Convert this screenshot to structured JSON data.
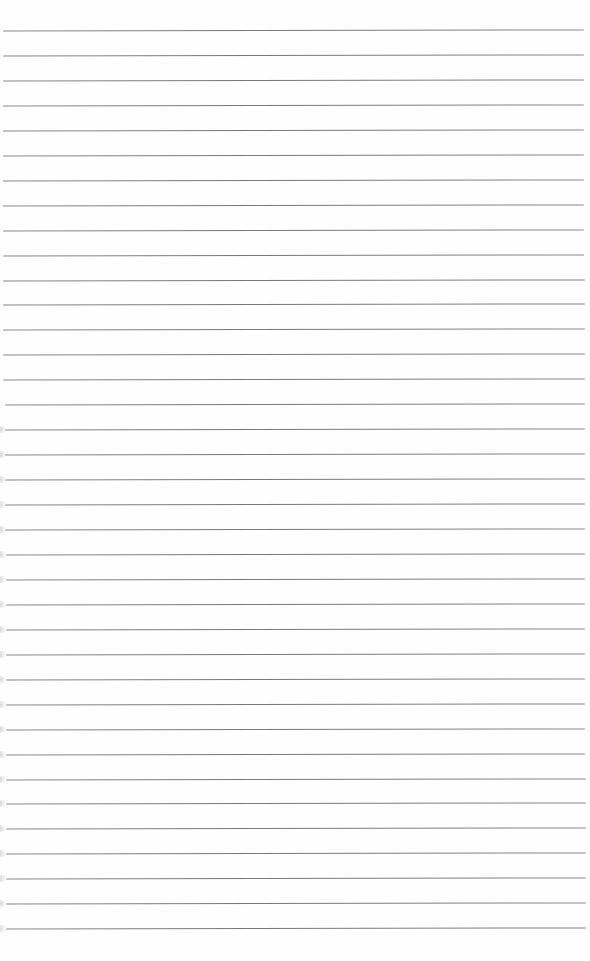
{
  "page": {
    "type": "lined-paper",
    "background_color": "#fefefe",
    "line_color": "#7f7f7f",
    "line_count": 37,
    "first_line_y": 30,
    "line_spacing": 24.95,
    "line_left_start": 3,
    "line_right_end": 584,
    "notches_start_index": 16
  }
}
